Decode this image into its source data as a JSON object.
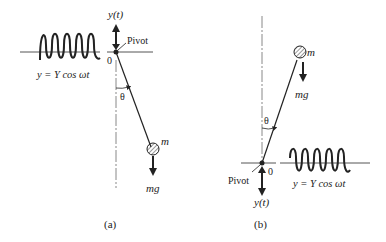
{
  "figure_a": {
    "caption": "(a)",
    "displacement_label": "y(t)",
    "pivot_label": "Pivot",
    "origin_label": "0",
    "angle_label": "θ",
    "mass_label": "m",
    "force_label": "mg",
    "equation": "y = Y cos ωt"
  },
  "figure_b": {
    "caption": "(b)",
    "displacement_label": "y(t)",
    "pivot_label": "Pivot",
    "origin_label": "0",
    "angle_label": "θ",
    "mass_label": "m",
    "force_label": "mg",
    "equation": "y = Y cos ωt"
  },
  "colors": {
    "ink": "#222222",
    "centerline": "#888888"
  }
}
